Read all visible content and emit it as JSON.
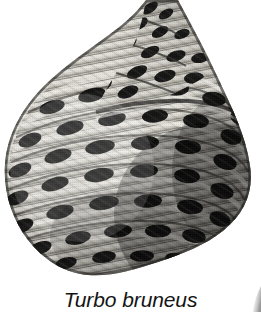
{
  "figure": {
    "caption": "Turbo bruneus",
    "subject_icon": "seashell-icon",
    "artifact_icon": "page-edge-smudge-icon",
    "background_color": "#ffffff",
    "ink_color": "#141414",
    "shell": {
      "tone_dark": "#0d0d0d",
      "tone_mid": "#6f6f6f",
      "tone_light": "#e6e6e2",
      "tone_shadow": "#262626",
      "highlight": "#f4f3ef"
    }
  }
}
